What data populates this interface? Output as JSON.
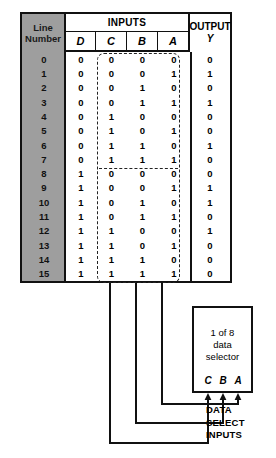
{
  "table": {
    "line_number_header": [
      "Line",
      "Number"
    ],
    "inputs_header": "INPUTS",
    "output_header": "OUTPUT",
    "output_var": "Y",
    "input_vars": [
      "D",
      "C",
      "B",
      "A"
    ],
    "rows": [
      {
        "n": "0",
        "D": "0",
        "C": "0",
        "B": "0",
        "A": "0",
        "Y": "0"
      },
      {
        "n": "1",
        "D": "0",
        "C": "0",
        "B": "0",
        "A": "1",
        "Y": "1"
      },
      {
        "n": "2",
        "D": "0",
        "C": "0",
        "B": "1",
        "A": "0",
        "Y": "0"
      },
      {
        "n": "3",
        "D": "0",
        "C": "0",
        "B": "1",
        "A": "1",
        "Y": "1"
      },
      {
        "n": "4",
        "D": "0",
        "C": "1",
        "B": "0",
        "A": "0",
        "Y": "0"
      },
      {
        "n": "5",
        "D": "0",
        "C": "1",
        "B": "0",
        "A": "1",
        "Y": "0"
      },
      {
        "n": "6",
        "D": "0",
        "C": "1",
        "B": "1",
        "A": "0",
        "Y": "1"
      },
      {
        "n": "7",
        "D": "0",
        "C": "1",
        "B": "1",
        "A": "1",
        "Y": "0"
      },
      {
        "n": "8",
        "D": "1",
        "C": "0",
        "B": "0",
        "A": "0",
        "Y": "0"
      },
      {
        "n": "9",
        "D": "1",
        "C": "0",
        "B": "0",
        "A": "1",
        "Y": "1"
      },
      {
        "n": "10",
        "D": "1",
        "C": "0",
        "B": "1",
        "A": "0",
        "Y": "1"
      },
      {
        "n": "11",
        "D": "1",
        "C": "0",
        "B": "1",
        "A": "1",
        "Y": "0"
      },
      {
        "n": "12",
        "D": "1",
        "C": "1",
        "B": "0",
        "A": "0",
        "Y": "1"
      },
      {
        "n": "13",
        "D": "1",
        "C": "1",
        "B": "0",
        "A": "1",
        "Y": "0"
      },
      {
        "n": "14",
        "D": "1",
        "C": "1",
        "B": "1",
        "A": "0",
        "Y": "0"
      },
      {
        "n": "15",
        "D": "1",
        "C": "1",
        "B": "1",
        "A": "1",
        "Y": "0"
      }
    ]
  },
  "diagram": {
    "selector_lines": [
      "1 of 8",
      "data",
      "selector"
    ],
    "pins": [
      "C",
      "B",
      "A"
    ],
    "data_select_label": [
      "DATA",
      "SELECT",
      "INPUTS"
    ]
  },
  "colors": {
    "line_number_band": "#9e9e9e",
    "ink": "#111111",
    "background": "#ffffff",
    "dashed": "#222222"
  }
}
